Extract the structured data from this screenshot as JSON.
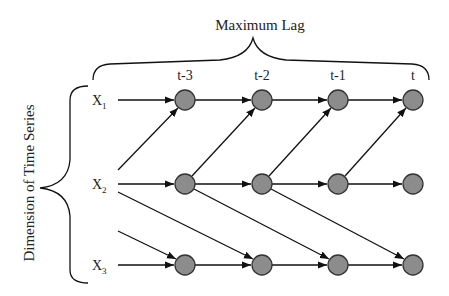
{
  "diagram": {
    "title": "Maximum Lag",
    "vertical_label": "Dimension of Time Series",
    "node_color": "#8c8c8c",
    "columns": [
      {
        "label": "t-3",
        "x": 185
      },
      {
        "label": "t-2",
        "x": 262
      },
      {
        "label": "t-1",
        "x": 338
      },
      {
        "label": "t",
        "x": 413
      }
    ],
    "rows": [
      {
        "label": "X",
        "sub": "1",
        "y": 100
      },
      {
        "label": "X",
        "sub": "2",
        "y": 184
      },
      {
        "label": "X",
        "sub": "3",
        "y": 265
      }
    ],
    "edges": [
      {
        "from": "X1",
        "to": "X1@t-3"
      },
      {
        "from": "X1@t-3",
        "to": "X1@t-2"
      },
      {
        "from": "X1@t-2",
        "to": "X1@t-1"
      },
      {
        "from": "X1@t-1",
        "to": "X1@t"
      },
      {
        "from": "X2",
        "to": "X1@t-3"
      },
      {
        "from": "X2",
        "to": "X2@t-3"
      },
      {
        "from": "X2@t-3",
        "to": "X2@t-2"
      },
      {
        "from": "X2@t-2",
        "to": "X2@t-1"
      },
      {
        "from": "X2@t-1",
        "to": "X2@t"
      },
      {
        "from": "X2@t-3",
        "to": "X1@t-2"
      },
      {
        "from": "X2@t-2",
        "to": "X1@t-1"
      },
      {
        "from": "X2@t-1",
        "to": "X1@t"
      },
      {
        "from": "X2",
        "to": "X3@t-2"
      },
      {
        "from": "X2@t-3",
        "to": "X3@t-1"
      },
      {
        "from": "X2@t-2",
        "to": "X3@t"
      },
      {
        "from": "X3-prev",
        "to": "X3@t-3"
      },
      {
        "from": "X3",
        "to": "X3@t-3"
      },
      {
        "from": "X3@t-3",
        "to": "X3@t-2"
      },
      {
        "from": "X3@t-2",
        "to": "X3@t-1"
      },
      {
        "from": "X3@t-1",
        "to": "X3@t"
      }
    ]
  }
}
